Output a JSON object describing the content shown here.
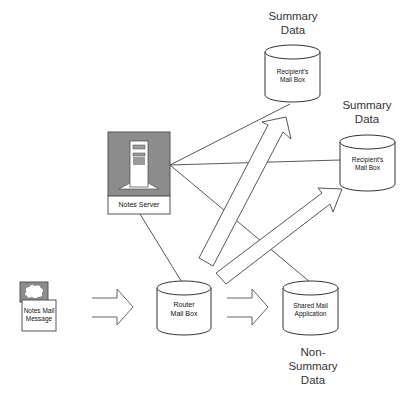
{
  "diagram": {
    "nodes": {
      "recipient_mailbox_1": {
        "label_line1": "Recipient's",
        "label_line2": "Mail Box",
        "caption_line1": "Summary",
        "caption_line2": "Data"
      },
      "recipient_mailbox_2": {
        "label_line1": "Recipient's",
        "label_line2": "Mail Box",
        "caption_line1": "Summary",
        "caption_line2": "Data"
      },
      "notes_server": {
        "label": "Notes Server"
      },
      "notes_mail_message": {
        "label_line1": "Notes Mail",
        "label_line2": "Message"
      },
      "router_mailbox": {
        "label_line1": "Router",
        "label_line2": "Mail Box"
      },
      "shared_mail_application": {
        "label_line1": "Shared Mail",
        "label_line2": "Application",
        "caption_line1": "Non-",
        "caption_line2": "Summary",
        "caption_line3": "Data"
      }
    },
    "edges": [
      {
        "from": "notes_server",
        "to": "recipient_mailbox_1",
        "type": "line"
      },
      {
        "from": "notes_server",
        "to": "recipient_mailbox_2",
        "type": "line"
      },
      {
        "from": "notes_server",
        "to": "shared_mail_application",
        "type": "line"
      },
      {
        "from": "notes_server",
        "to": "router_mailbox",
        "type": "line"
      },
      {
        "from": "notes_mail_message",
        "to": "router_mailbox",
        "type": "hollow-arrow"
      },
      {
        "from": "router_mailbox",
        "to": "shared_mail_application",
        "type": "hollow-arrow"
      },
      {
        "from": "router_mailbox",
        "to": "recipient_mailbox_1",
        "type": "hollow-arrow"
      },
      {
        "from": "router_mailbox",
        "to": "recipient_mailbox_2",
        "type": "hollow-arrow"
      }
    ],
    "colors": {
      "icon_gray": "#8c8c8c",
      "stroke": "#333333",
      "background": "#ffffff"
    }
  }
}
